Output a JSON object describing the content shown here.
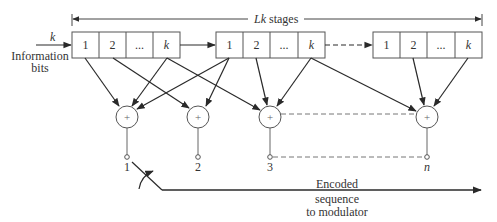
{
  "diagram": {
    "span_label": {
      "L": "L",
      "k": "k",
      "text": " stages"
    },
    "input": {
      "symbol": "k",
      "label_line1": "Information",
      "label_line2": "bits"
    },
    "registers": [
      {
        "cells": [
          "1",
          "2",
          "...",
          "k"
        ]
      },
      {
        "cells": [
          "1",
          "2",
          "...",
          "k"
        ]
      },
      {
        "cells": [
          "1",
          "2",
          "...",
          "k"
        ]
      }
    ],
    "adders": [
      {
        "symbol": "+",
        "output_label": "1"
      },
      {
        "symbol": "+",
        "output_label": "2"
      },
      {
        "symbol": "+",
        "output_label": "3"
      },
      {
        "symbol": "+",
        "output_label": "n"
      }
    ],
    "output": {
      "line1": "Encoded",
      "line2": "sequence",
      "line3": "to modulator"
    },
    "colors": {
      "stroke": "#2a2a2a",
      "light_stroke": "#666666",
      "text": "#333333"
    }
  }
}
